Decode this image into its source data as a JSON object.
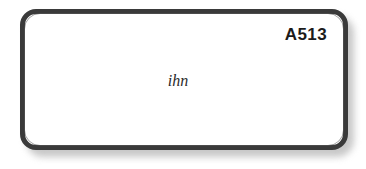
{
  "card": {
    "code_label": "A513",
    "word": "ihn",
    "border_color": "#3a3a3a",
    "fill_color": "#ffffff",
    "shadow_color": "#9a9a9a",
    "code_color": "#1b1b1b",
    "word_color": "#2b2b2b"
  },
  "canvas": {
    "background": "#ffffff",
    "width": 366,
    "height": 169
  }
}
